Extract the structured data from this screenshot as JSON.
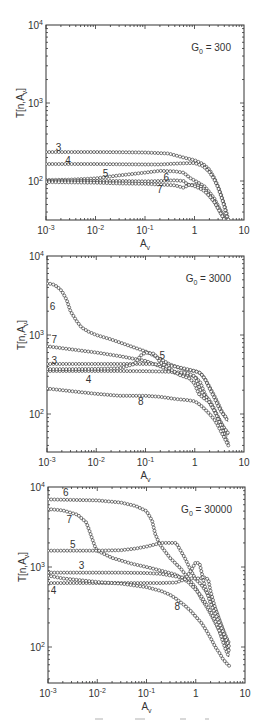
{
  "chart_data": [
    {
      "type": "line",
      "title": "G0 = 300",
      "annotation": {
        "text_main": "G",
        "text_sub": "0",
        "text_rest": " = 300"
      },
      "xlabel": "A_v",
      "ylabel": "T[n,A_v]",
      "xscale": "log",
      "yscale": "log",
      "xlim": [
        0.001,
        10
      ],
      "ylim": [
        31,
        10000
      ],
      "xticks": [
        "10^-3",
        "10^-2",
        "10^-1",
        "1",
        "10"
      ],
      "yticks": [
        "10^2",
        "10^3",
        "10^4"
      ],
      "markers": "open circles",
      "series": [
        {
          "name": "3",
          "label_pos": [
            0.0018,
            270
          ],
          "x": [
            0.001,
            0.003,
            0.01,
            0.03,
            0.1,
            0.3,
            0.6,
            1,
            1.5,
            2,
            2.5,
            3,
            3.5,
            4,
            4.5,
            4.8
          ],
          "y": [
            235,
            235,
            235,
            234,
            232,
            225,
            200,
            185,
            165,
            140,
            110,
            85,
            65,
            50,
            38,
            32
          ]
        },
        {
          "name": "4",
          "label_pos": [
            0.0028,
            185
          ],
          "x": [
            0.001,
            0.003,
            0.01,
            0.03,
            0.1,
            0.2,
            0.5,
            1,
            1.5,
            2,
            2.5,
            3,
            3.5,
            4,
            4.5
          ],
          "y": [
            165,
            165,
            165,
            164,
            163,
            163,
            168,
            170,
            155,
            130,
            105,
            82,
            62,
            47,
            35
          ]
        },
        {
          "name": "5",
          "label_pos": [
            0.016,
            125
          ],
          "x": [
            0.001,
            0.003,
            0.01,
            0.03,
            0.1,
            0.2,
            0.4,
            0.6,
            0.8,
            1.2,
            1.6,
            2,
            2.5,
            3,
            3.5,
            4,
            4.5
          ],
          "y": [
            103,
            104,
            108,
            118,
            128,
            135,
            133,
            128,
            110,
            95,
            85,
            72,
            60,
            48,
            40,
            34,
            31
          ]
        },
        {
          "name": "6",
          "label_pos": [
            0.27,
            113
          ],
          "x": [
            0.001,
            0.003,
            0.01,
            0.03,
            0.1,
            0.2,
            0.4,
            0.6,
            0.7,
            0.8,
            1,
            1.3,
            1.6,
            2,
            2.5,
            3,
            3.5,
            4,
            4.5
          ],
          "y": [
            100,
            100,
            100,
            100,
            99,
            100,
            102,
            100,
            92,
            88,
            90,
            86,
            78,
            66,
            55,
            45,
            38,
            33,
            30
          ]
        },
        {
          "name": "7",
          "label_pos": [
            0.2,
            80
          ],
          "x": [
            0.001,
            0.003,
            0.01,
            0.03,
            0.1,
            0.2,
            0.4,
            0.6,
            0.8,
            1,
            1.3,
            1.6,
            2,
            2.5,
            3,
            3.5,
            4,
            4.5
          ],
          "y": [
            97,
            96,
            95,
            93,
            92,
            90,
            88,
            82,
            90,
            86,
            80,
            74,
            64,
            54,
            44,
            37,
            32,
            29
          ]
        }
      ]
    },
    {
      "type": "line",
      "title": "G0 = 3000",
      "annotation": {
        "text_main": "G",
        "text_sub": "0",
        "text_rest": " = 3000"
      },
      "xlabel": "A_v",
      "ylabel": "T[n,A_v]",
      "xscale": "log",
      "yscale": "log",
      "xlim": [
        0.001,
        10
      ],
      "ylim": [
        31,
        10000
      ],
      "xticks": [
        "10^-3",
        "10^-2",
        "10^-1",
        "1",
        "10"
      ],
      "yticks": [
        "10^2",
        "10^3",
        "10^4"
      ],
      "markers": "open circles",
      "series": [
        {
          "name": "6",
          "label_pos": [
            0.0013,
            2300
          ],
          "x": [
            0.001,
            0.0013,
            0.0016,
            0.002,
            0.0025,
            0.003,
            0.004,
            0.005,
            0.007,
            0.01,
            0.02,
            0.05,
            0.1,
            0.2,
            0.3,
            0.5,
            0.7,
            1,
            1.3,
            1.6,
            2,
            2.5,
            3,
            3.5,
            4,
            4.5,
            4.7
          ],
          "y": [
            4500,
            4400,
            4100,
            3600,
            2800,
            2000,
            1500,
            1250,
            1100,
            1000,
            880,
            720,
            620,
            500,
            430,
            380,
            360,
            350,
            330,
            280,
            220,
            170,
            135,
            110,
            95,
            85,
            80
          ]
        },
        {
          "name": "7",
          "label_pos": [
            0.0014,
            880
          ],
          "x": [
            0.001,
            0.003,
            0.01,
            0.03,
            0.1,
            0.2,
            0.4,
            0.7,
            1,
            1.3,
            1.6,
            2,
            2.5,
            3,
            3.5,
            4,
            4.5,
            4.7
          ],
          "y": [
            720,
            660,
            600,
            540,
            470,
            400,
            330,
            310,
            300,
            250,
            180,
            140,
            110,
            90,
            75,
            65,
            58,
            55
          ]
        },
        {
          "name": "3",
          "label_pos": [
            0.0014,
            480
          ],
          "x": [
            0.001,
            0.003,
            0.01,
            0.03,
            0.1,
            0.2,
            0.4,
            0.7,
            1,
            1.3,
            1.6,
            2,
            2.5,
            3,
            3.5,
            4,
            4.5,
            4.7
          ],
          "y": [
            430,
            430,
            430,
            430,
            430,
            425,
            400,
            370,
            350,
            330,
            280,
            210,
            160,
            125,
            105,
            95,
            90,
            88
          ]
        },
        {
          "name": "4",
          "label_pos": [
            0.007,
            275
          ],
          "x": [
            0.001,
            0.003,
            0.01,
            0.03,
            0.1,
            0.2,
            0.4,
            0.7,
            1,
            1.3,
            1.6,
            2,
            2.5,
            3,
            3.5,
            4,
            4.5,
            4.7
          ],
          "y": [
            350,
            350,
            350,
            350,
            348,
            345,
            340,
            330,
            300,
            200,
            170,
            150,
            115,
            90,
            75,
            66,
            60,
            58
          ]
        },
        {
          "name": "5",
          "label_pos": [
            0.22,
            560
          ],
          "x": [
            0.001,
            0.003,
            0.01,
            0.03,
            0.06,
            0.08,
            0.1,
            0.15,
            0.2,
            0.3,
            0.5,
            0.8,
            1,
            1.2,
            1.5,
            2,
            2.5,
            3,
            3.5,
            4,
            4.5,
            4.8
          ],
          "y": [
            370,
            370,
            372,
            380,
            430,
            550,
            600,
            580,
            450,
            380,
            310,
            280,
            240,
            180,
            160,
            140,
            110,
            85,
            68,
            55,
            46,
            42
          ]
        },
        {
          "name": "8",
          "label_pos": [
            0.08,
            145
          ],
          "x": [
            0.001,
            0.003,
            0.01,
            0.03,
            0.1,
            0.2,
            0.4,
            0.7,
            1,
            1.3,
            1.6,
            2,
            2.5,
            3,
            3.5,
            4,
            4.5,
            4.8
          ],
          "y": [
            210,
            195,
            180,
            170,
            170,
            165,
            155,
            150,
            145,
            130,
            115,
            100,
            85,
            70,
            58,
            50,
            43,
            40
          ]
        }
      ]
    },
    {
      "type": "line",
      "title": "G0 = 30000",
      "annotation": {
        "text_main": "G",
        "text_sub": "0",
        "text_rest": " = 30000"
      },
      "xlabel": "A_v",
      "ylabel": "T[n,A_v]",
      "xscale": "log",
      "yscale": "log",
      "xlim": [
        0.001,
        10
      ],
      "ylim": [
        31,
        10000
      ],
      "xticks": [
        "10^-3",
        "10^-2",
        "10^-1",
        "1",
        "10"
      ],
      "yticks": [
        "10^2",
        "10^3",
        "10^4"
      ],
      "markers": "open circles",
      "series": [
        {
          "name": "6",
          "label_pos": [
            0.0023,
            8600
          ],
          "x": [
            0.001,
            0.003,
            0.01,
            0.03,
            0.06,
            0.1,
            0.13,
            0.15,
            0.18,
            0.2,
            0.3,
            0.5,
            0.8,
            1,
            1.3,
            1.6,
            2,
            2.5,
            3,
            3.5,
            4,
            4.5,
            4.7
          ],
          "y": [
            7000,
            6900,
            6800,
            6400,
            5800,
            5000,
            3800,
            2600,
            2000,
            1800,
            1300,
            950,
            650,
            550,
            400,
            330,
            260,
            200,
            160,
            130,
            110,
            95,
            90
          ]
        },
        {
          "name": "7",
          "label_pos": [
            0.0027,
            4000
          ],
          "x": [
            0.001,
            0.002,
            0.004,
            0.006,
            0.007,
            0.008,
            0.009,
            0.01,
            0.02,
            0.05,
            0.1,
            0.2,
            0.4,
            0.7,
            1,
            1.3,
            1.6,
            2,
            2.5,
            3,
            3.5,
            4,
            4.5,
            4.7
          ],
          "y": [
            5300,
            5100,
            4500,
            3600,
            2800,
            2200,
            1800,
            1600,
            1300,
            1100,
            1000,
            900,
            800,
            650,
            520,
            430,
            350,
            280,
            210,
            160,
            120,
            95,
            80,
            75
          ]
        },
        {
          "name": "5",
          "label_pos": [
            0.0032,
            1950
          ],
          "x": [
            0.001,
            0.003,
            0.01,
            0.03,
            0.06,
            0.1,
            0.2,
            0.4,
            0.6,
            0.8,
            1,
            1.3,
            1.6,
            2,
            2.5,
            3,
            3.5,
            4,
            4.5,
            4.8
          ],
          "y": [
            1600,
            1600,
            1600,
            1620,
            1700,
            1800,
            2000,
            2000,
            1300,
            900,
            700,
            600,
            500,
            400,
            300,
            220,
            170,
            130,
            100,
            85
          ]
        },
        {
          "name": "3",
          "label_pos": [
            0.0048,
            1050
          ],
          "x": [
            0.001,
            0.003,
            0.01,
            0.03,
            0.1,
            0.2,
            0.4,
            0.7,
            1,
            1.2,
            1.5,
            1.8,
            2,
            2.5,
            3,
            3.5,
            4,
            4.5,
            4.8
          ],
          "y": [
            850,
            850,
            850,
            850,
            840,
            820,
            760,
            720,
            720,
            720,
            740,
            700,
            500,
            300,
            220,
            170,
            140,
            120,
            110
          ]
        },
        {
          "name": "4",
          "label_pos": [
            0.0013,
            520
          ],
          "x": [
            0.001,
            0.003,
            0.01,
            0.03,
            0.1,
            0.2,
            0.4,
            0.6,
            0.8,
            1,
            1.2,
            1.5,
            2,
            2.5,
            3,
            3.5,
            4,
            4.5,
            4.8
          ],
          "y": [
            630,
            630,
            630,
            630,
            630,
            630,
            640,
            700,
            900,
            1150,
            1100,
            600,
            350,
            260,
            200,
            160,
            130,
            110,
            100
          ]
        },
        {
          "name": "8",
          "label_pos": [
            0.42,
            330
          ],
          "x": [
            0.001,
            0.002,
            0.005,
            0.01,
            0.03,
            0.1,
            0.2,
            0.3,
            0.4,
            0.6,
            0.8,
            1,
            1.3,
            1.6,
            2,
            2.5,
            3,
            3.5,
            4,
            4.5,
            4.8
          ],
          "y": [
            780,
            720,
            680,
            650,
            620,
            560,
            500,
            450,
            400,
            330,
            280,
            240,
            200,
            165,
            130,
            100,
            85,
            72,
            65,
            60,
            58
          ]
        }
      ]
    }
  ],
  "panels_layout": [
    {
      "left": 46,
      "right": 244,
      "top": 25,
      "decade_px": 78,
      "bottom": 220
    },
    {
      "left": 47,
      "right": 244,
      "top": 256,
      "decade_px": 79,
      "bottom": 452
    },
    {
      "left": 48,
      "right": 245,
      "top": 487,
      "decade_px": 80,
      "bottom": 683
    }
  ],
  "axis_text": {
    "x_tick_labels": [
      {
        "base": "10",
        "exp": "-3"
      },
      {
        "base": "10",
        "exp": "-2"
      },
      {
        "base": "10",
        "exp": "-1"
      },
      {
        "base": "1",
        "exp": ""
      },
      {
        "base": "10",
        "exp": ""
      }
    ],
    "y_tick_labels": [
      {
        "base": "10",
        "exp": "2"
      },
      {
        "base": "10",
        "exp": "3"
      },
      {
        "base": "10",
        "exp": "4"
      }
    ],
    "xlabel_main": "A",
    "xlabel_sub": "v",
    "ylabel_text": "T[n,A",
    "ylabel_sub": "v",
    "ylabel_close": "]"
  },
  "colors": {
    "ink": "#2a2a2a",
    "axis": "#333333",
    "background": "#ffffff"
  }
}
